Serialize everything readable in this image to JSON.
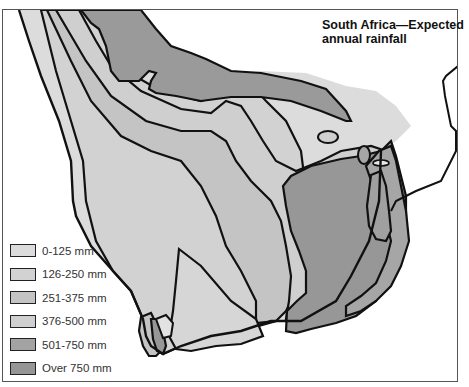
{
  "map": {
    "title_line1": "South Africa—Expected",
    "title_line2": "annual rainfall",
    "colors": {
      "background": "#ffffff",
      "outline": "#111111",
      "band_0_125": "#dcdcdc",
      "band_126_250": "#d2d2d2",
      "band_251_375": "#c4c4c4",
      "band_376_500": "#cfcfcf",
      "band_501_750": "#a6a6a6",
      "band_over_750": "#979797"
    }
  },
  "legend": {
    "items": [
      {
        "label": "0-125 mm",
        "color": "#dcdcdc"
      },
      {
        "label": "126-250 mm",
        "color": "#d2d2d2"
      },
      {
        "label": "251-375 mm",
        "color": "#c4c4c4"
      },
      {
        "label": "376-500 mm",
        "color": "#cfcfcf"
      },
      {
        "label": "501-750 mm",
        "color": "#a3a3a3"
      },
      {
        "label": "Over 750 mm",
        "color": "#959595"
      }
    ]
  }
}
